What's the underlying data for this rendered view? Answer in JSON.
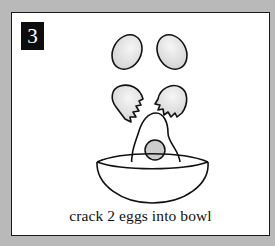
{
  "card": {
    "step_number": "3",
    "caption": "crack 2 eggs into bowl"
  },
  "illustration": {
    "elements": [
      "whole-egg-left",
      "whole-egg-right",
      "cracked-shell-left",
      "cracked-shell-right",
      "egg-yolk-white",
      "bowl"
    ]
  },
  "colors": {
    "background": "#b9b9b9",
    "card": "#ffffff",
    "badge": "#0d0d0d",
    "line": "#111111",
    "egg_fill": "#dcdcdc"
  }
}
